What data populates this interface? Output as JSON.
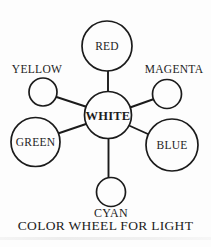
{
  "diagram": {
    "caption": "COLOR WHEEL FOR LIGHT",
    "center": {
      "label": "WHITE"
    },
    "nodes": {
      "red": {
        "label": "RED"
      },
      "yellow": {
        "label": "YELLOW"
      },
      "magenta": {
        "label": "MAGENTA"
      },
      "green": {
        "label": "GREEN"
      },
      "blue": {
        "label": "BLUE"
      },
      "cyan": {
        "label": "CYAN"
      }
    },
    "colors": {
      "line": "#1b1b1b",
      "text": "#1c1c1c",
      "background": "#fdfdfd"
    }
  }
}
